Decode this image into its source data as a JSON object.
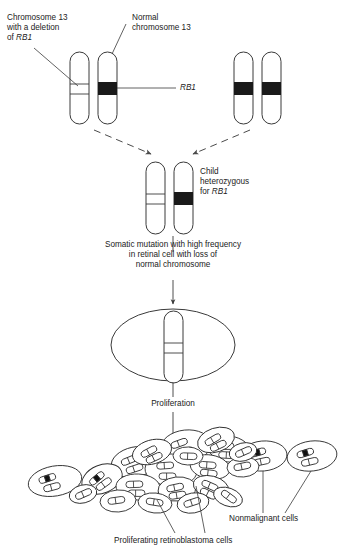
{
  "diagram": {
    "colors": {
      "stroke": "#3a3a3a",
      "band": "#1a1a1a",
      "text": "#222222",
      "background": "#ffffff"
    }
  },
  "labels": {
    "parent_deleted": "Chromosome 13\nwith a deletion\nof ",
    "parent_deleted_gene": "RB1",
    "parent_normal": "Normal\nchromosome 13",
    "gene_callout": "RB1",
    "child": "Child\nheterozygous\nfor ",
    "child_gene": "RB1",
    "somatic": "Somatic mutation with high frequency\nin retinal cell with loss of\nnormal chromosome",
    "proliferation": "Proliferation",
    "nonmalignant": "Nonmalignant cells",
    "tumor": "Proliferating retinoblastoma cells"
  },
  "chromosomes": {
    "parent_pair_left": [
      {
        "name": "deleted-chromosome-13",
        "band": "deletion"
      },
      {
        "name": "normal-chromosome-13",
        "band": "rb1-black"
      }
    ],
    "parent_pair_right": [
      {
        "name": "normal-chromosome-13-a",
        "band": "rb1-black"
      },
      {
        "name": "normal-chromosome-13-b",
        "band": "rb1-black"
      }
    ],
    "child_pair": [
      {
        "name": "child-deleted-chromosome",
        "band": "deletion"
      },
      {
        "name": "child-normal-chromosome",
        "band": "rb1-black"
      }
    ],
    "retinal_cell": [
      {
        "name": "mutant-chromosome",
        "band": "deletion"
      }
    ]
  },
  "cell_cluster": {
    "tumor_cell_count": 21,
    "nonmalignant_cell_count": 4
  }
}
